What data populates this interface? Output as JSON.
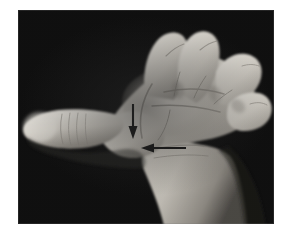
{
  "figure": {
    "kind": "clinical-photograph",
    "modality": "black-and-white photograph",
    "alt_text": "Black and white photograph of a hand with the palm facing the camera and the thumb held out to the side. Two black arrows point to the base of the thumb at the wrist.",
    "background_color": "#0b0b0b",
    "page_color": "#ffffff",
    "annotation_color": "#141414"
  },
  "plate": {
    "left": 18,
    "top": 10,
    "width": 256,
    "height": 214
  },
  "annotations": [
    {
      "id": "arrow-vertical",
      "name": "downward-arrow",
      "direction": "down",
      "points_to": "thenar eminence",
      "x1": 133,
      "y1": 104,
      "x2": 133,
      "y2": 139,
      "color": "#141414"
    },
    {
      "id": "arrow-horizontal",
      "name": "leftward-arrow",
      "direction": "left",
      "points_to": "wrist crease at base of thumb",
      "x1": 186,
      "y1": 148,
      "x2": 141,
      "y2": 148,
      "color": "#141414"
    }
  ],
  "anatomy_labels": {
    "thumb": "thumb",
    "index_finger": "index finger",
    "middle_finger": "middle finger",
    "ring_finger": "ring finger",
    "little_finger": "little finger",
    "palm": "palm",
    "thenar_eminence": "thenar eminence",
    "wrist": "wrist",
    "forearm": "forearm"
  }
}
